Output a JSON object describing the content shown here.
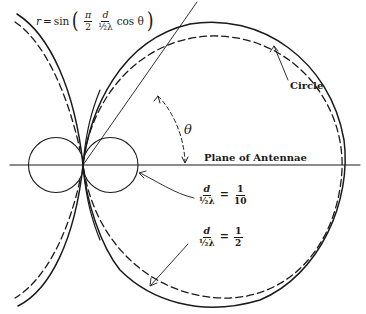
{
  "figure": {
    "formula": {
      "lhs": "r",
      "equals": "=",
      "func": "sin",
      "open_paren": "(",
      "close_paren": ")",
      "pi_over_2": {
        "num": "π",
        "den": "2"
      },
      "d_over_half_lambda": {
        "num": "d",
        "den": "½λ"
      },
      "tail": "cos θ"
    },
    "labels": {
      "circle": "Circle",
      "plane": "Plane of Antennae",
      "theta": "θ"
    },
    "ratio_small": {
      "num": "d",
      "den": "½λ",
      "equals": "=",
      "value_num": "1",
      "value_den": "10"
    },
    "ratio_large": {
      "num": "d",
      "den": "½λ",
      "equals": "=",
      "value_num": "1",
      "value_den": "2"
    },
    "colors": {
      "ink": "#1a1a1a",
      "background": "#ffffff"
    }
  }
}
